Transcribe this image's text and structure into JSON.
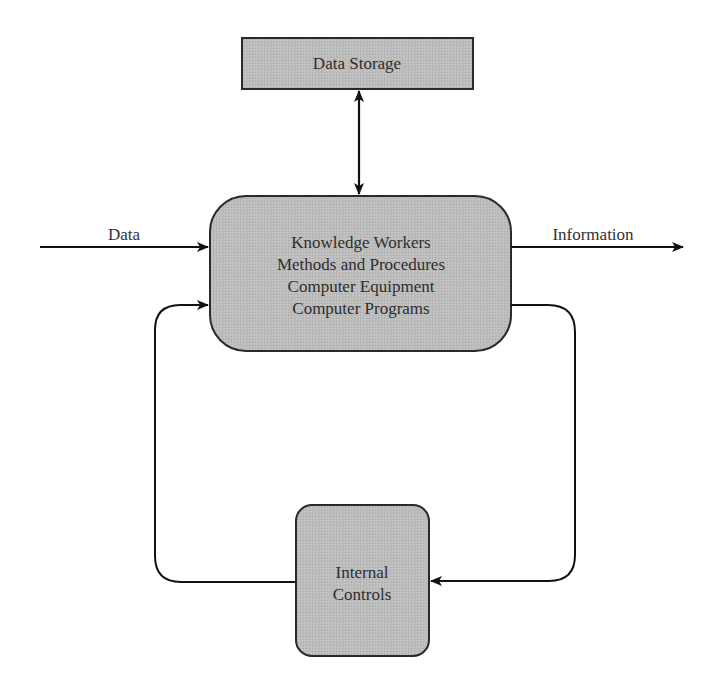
{
  "diagram": {
    "type": "information-system-flow",
    "colors": {
      "box_fill": "#b9b9b9",
      "box_stroke": "#2a2a2a",
      "line": "#111111",
      "text": "#2e2e2e",
      "background": "#ffffff"
    },
    "nodes": {
      "data_storage": {
        "label": "Data Storage"
      },
      "processing": {
        "lines": [
          "Knowledge Workers",
          "Methods and Procedures",
          "Computer Equipment",
          "Computer Programs"
        ]
      },
      "internal_controls": {
        "lines": [
          "Internal",
          "Controls"
        ]
      }
    },
    "edges": {
      "input": {
        "label": "Data",
        "from": "outside",
        "to": "processing"
      },
      "output": {
        "label": "Information",
        "from": "processing",
        "to": "outside"
      },
      "storage_link": {
        "from": "processing",
        "to": "data_storage",
        "bidirectional": true
      },
      "feedback_out": {
        "from": "processing",
        "to": "internal_controls"
      },
      "feedback_in": {
        "from": "internal_controls",
        "to": "processing"
      }
    }
  }
}
